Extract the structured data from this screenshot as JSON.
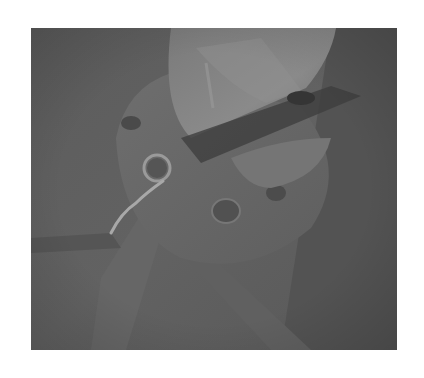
{
  "image": {
    "description": "Grayscale photograph of a mechanical joint: a rounded bracket arm over a circular flange plate with bolt holes and a small ring pin with a bent wire clip",
    "colors": {
      "background": "#ffffff",
      "photo_base": "#5e5e5e",
      "highlight": "#8a8a8a",
      "shadow": "#3e3e3e"
    }
  }
}
